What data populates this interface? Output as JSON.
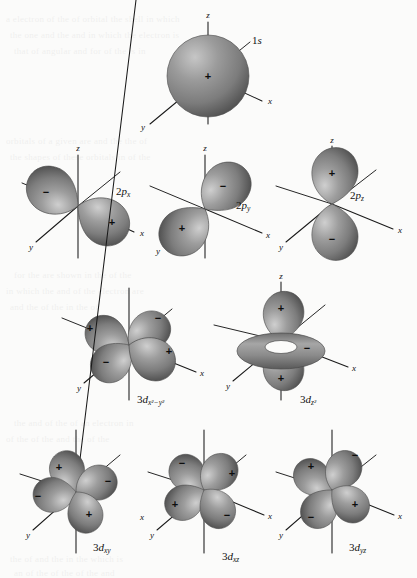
{
  "figure": {
    "background_color": "#fbfbfa",
    "ink_color": "#1a1a1a",
    "lobe_color": "#8a8a8a",
    "lobe_highlight": "#c9c9c9",
    "lobe_shadow": "#4f4f4f",
    "axis_labels": {
      "x": "x",
      "y": "y",
      "z": "z"
    },
    "sign_positive": "+",
    "sign_negative": "−"
  },
  "orbitals": [
    {
      "id": "1s",
      "label_main": "1",
      "label_sub": "s",
      "label_text": "1s",
      "row": 1,
      "type": "sphere",
      "signs": [
        "+"
      ]
    },
    {
      "id": "2px",
      "label_main": "2",
      "label_sub": "p",
      "label_sub2": "x",
      "label_text": "2pₓ",
      "row": 2,
      "type": "dumbbell",
      "signs": [
        "−",
        "+"
      ]
    },
    {
      "id": "2py",
      "label_main": "2",
      "label_sub": "p",
      "label_sub2": "y",
      "label_text": "2pᵧ",
      "row": 2,
      "type": "dumbbell",
      "signs": [
        "−",
        "+"
      ]
    },
    {
      "id": "2pz",
      "label_main": "2",
      "label_sub": "p",
      "label_sub2": "z",
      "label_text": "2pₔ",
      "row": 2,
      "type": "dumbbell",
      "signs": [
        "+",
        "−"
      ]
    },
    {
      "id": "3dx2-y2",
      "label_main": "3",
      "label_sub": "d",
      "label_sub2": "x²−y²",
      "label_text": "3dₓ²₋ᵧ²",
      "row": 3,
      "type": "cloverleaf",
      "signs": [
        "+",
        "−",
        "−",
        "+"
      ]
    },
    {
      "id": "3dz2",
      "label_main": "3",
      "label_sub": "d",
      "label_sub2": "z²",
      "label_text": "3dₔ²",
      "row": 3,
      "type": "torus-dumbbell",
      "signs": [
        "+",
        "−",
        "+"
      ]
    },
    {
      "id": "3dxy",
      "label_main": "3",
      "label_sub": "d",
      "label_sub2": "xy",
      "label_text": "3dₓᵧ",
      "row": 4,
      "type": "cloverleaf",
      "signs": [
        "+",
        "−",
        "−",
        "+"
      ]
    },
    {
      "id": "3dxz",
      "label_main": "3",
      "label_sub": "d",
      "label_sub2": "xz",
      "label_text": "3dₓₔ",
      "row": 4,
      "type": "cloverleaf",
      "signs": [
        "−",
        "+",
        "+",
        "−"
      ]
    },
    {
      "id": "3dyz",
      "label_main": "3",
      "label_sub": "d",
      "label_sub2": "yz",
      "label_text": "3dᵧₔ",
      "row": 4,
      "type": "cloverleaf",
      "signs": [
        "+",
        "−",
        "−",
        "+"
      ]
    }
  ],
  "showthrough_lines": [
    "a electron of the of orbital the shell in which",
    "the one and the and in which the electron is",
    "that of angular and for of the is in",
    "orbitals of a given are and the the of",
    "the shapes of these orbitals in of the",
    "for the are shown in the of the",
    "in which the and of the electron are",
    "and the of the in the of",
    "the and of the of an electron in",
    "of the of the and the of the",
    "the of and the in the which is",
    "an of the of the of the and"
  ]
}
